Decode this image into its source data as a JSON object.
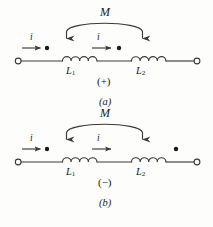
{
  "figure": {
    "type": "circuit-diagram",
    "background_color": "#fdfdfc",
    "line_color": "#3a3a3a",
    "text_color": "#1a1a1a"
  },
  "diagrams": [
    {
      "id": "a",
      "caption": "(a)",
      "sign_label": "(+)",
      "coupling_label": "M",
      "current_label_left": "i",
      "current_label_mid": "i",
      "inductor_left_label": "L",
      "inductor_left_sub": "1",
      "inductor_right_label": "L",
      "inductor_right_sub": "2",
      "dot_left_position": "left-of-L1",
      "dot_right_position": "left-of-L2",
      "terminal_left": "open-circle",
      "terminal_right": "open-circle"
    },
    {
      "id": "b",
      "caption": "(b)",
      "sign_label": "(−)",
      "coupling_label": "M",
      "current_label_left": "i",
      "current_label_mid": "i",
      "inductor_left_label": "L",
      "inductor_left_sub": "1",
      "inductor_right_label": "L",
      "inductor_right_sub": "2",
      "dot_left_position": "left-of-L1",
      "dot_right_position": "right-of-L2",
      "terminal_left": "open-circle",
      "terminal_right": "open-circle"
    }
  ]
}
